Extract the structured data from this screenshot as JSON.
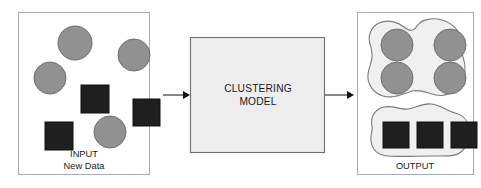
{
  "diagram": {
    "type": "flow-diagram",
    "colors": {
      "circle_fill": "#919191",
      "circle_stroke": "#6e6e6e",
      "square_fill": "#1f1f1f",
      "square_stroke": "#111111",
      "panel_fill": "#ffffff",
      "panel_stroke": "#a9a9b8",
      "model_fill": "#ededed",
      "model_stroke": "#6f6f6f",
      "blob_fill": "#f0f0f0",
      "blob_stroke": "#7a7a7a",
      "arrow_color": "#111111",
      "text_color": "#1a1a1a",
      "background": "#ffffff"
    },
    "input_panel": {
      "label_line1": "INPUT",
      "label_line2": "New Data",
      "shapes": [
        {
          "kind": "circle",
          "cx": 75,
          "cy": 43,
          "r": 17
        },
        {
          "kind": "circle",
          "cx": 134,
          "cy": 55,
          "r": 16
        },
        {
          "kind": "circle",
          "cx": 50,
          "cy": 78,
          "r": 16
        },
        {
          "kind": "circle",
          "cx": 110,
          "cy": 132,
          "r": 16
        },
        {
          "kind": "square",
          "x": 81,
          "y": 85,
          "size": 28
        },
        {
          "kind": "square",
          "x": 133,
          "y": 99,
          "size": 27
        },
        {
          "kind": "square",
          "x": 45,
          "y": 122,
          "size": 28
        }
      ]
    },
    "model_box": {
      "label_line1": "CLUSTERING",
      "label_line2": "MODEL"
    },
    "output_panel": {
      "label": "OUTPUT",
      "circle_cluster": {
        "name": "circle-cluster-blob",
        "members": [
          {
            "kind": "circle",
            "cx": 397,
            "cy": 45,
            "r": 16
          },
          {
            "kind": "circle",
            "cx": 450,
            "cy": 45,
            "r": 16
          },
          {
            "kind": "circle",
            "cx": 397,
            "cy": 78,
            "r": 16
          },
          {
            "kind": "circle",
            "cx": 450,
            "cy": 78,
            "r": 16
          }
        ]
      },
      "square_cluster": {
        "name": "square-cluster-blob",
        "members": [
          {
            "kind": "square",
            "x": 383,
            "y": 122,
            "size": 26
          },
          {
            "kind": "square",
            "x": 417,
            "y": 122,
            "size": 26
          },
          {
            "kind": "square",
            "x": 451,
            "y": 122,
            "size": 26
          }
        ]
      }
    },
    "arrows": [
      {
        "name": "arrow-input-to-model",
        "x1": 163,
        "y1": 95,
        "x2": 187
      },
      {
        "name": "arrow-model-to-output",
        "x1": 325,
        "y1": 95,
        "x2": 351
      }
    ]
  }
}
